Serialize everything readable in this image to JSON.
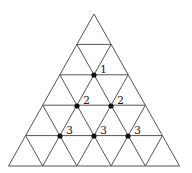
{
  "diagram": {
    "type": "triangular-grid",
    "rows": 5,
    "apex": [
      94,
      14
    ],
    "base_y": 166,
    "base_left_x": 10,
    "base_right_x": 181,
    "line_color": "#555555",
    "dot_color": "#111111",
    "points": [
      {
        "row": 2,
        "pos": 1,
        "x": 94,
        "y": 75,
        "label": "1"
      },
      {
        "row": 3,
        "pos": 1,
        "x": 77,
        "y": 106,
        "label": "2"
      },
      {
        "row": 3,
        "pos": 2,
        "x": 111,
        "y": 106,
        "label": "2"
      },
      {
        "row": 4,
        "pos": 1,
        "x": 60,
        "y": 136,
        "label": "3"
      },
      {
        "row": 4,
        "pos": 2,
        "x": 94,
        "y": 136,
        "label": "3"
      },
      {
        "row": 4,
        "pos": 3,
        "x": 128,
        "y": 136,
        "label": "3"
      }
    ]
  }
}
